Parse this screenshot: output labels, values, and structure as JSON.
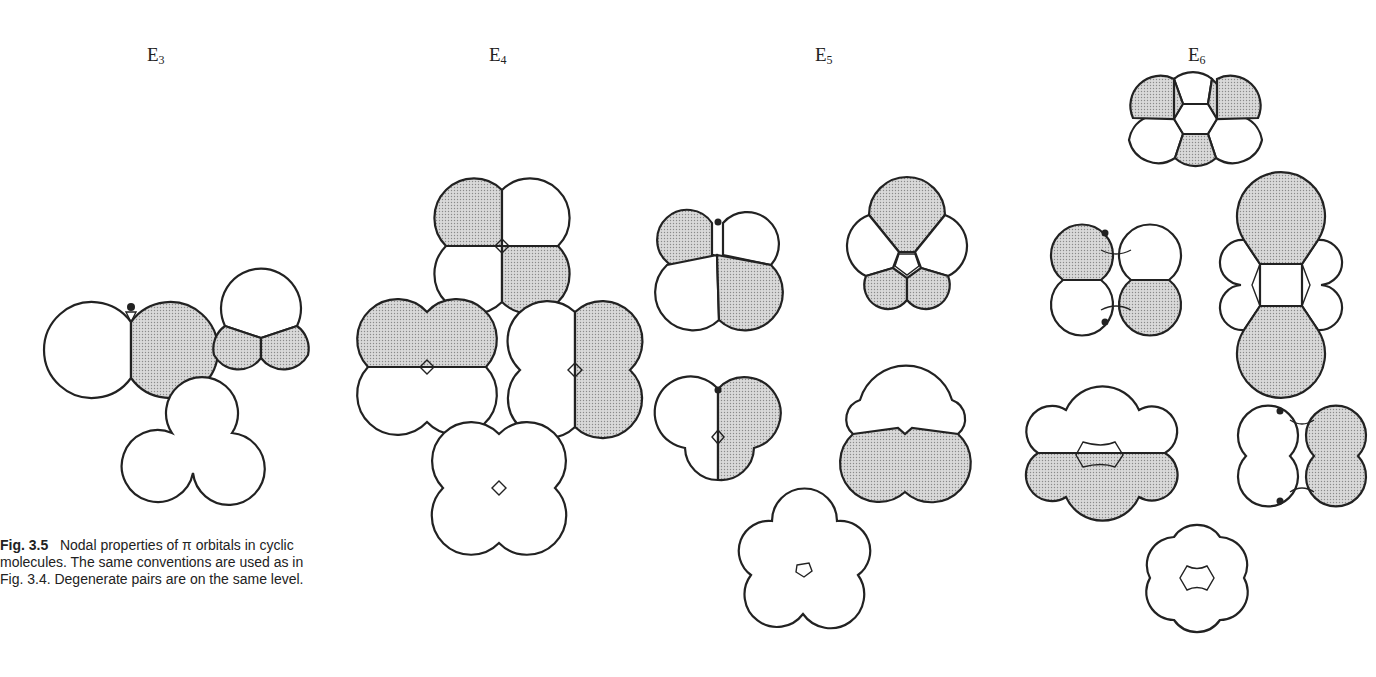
{
  "figure": {
    "columns": [
      {
        "id": "E3",
        "label_main": "E",
        "label_sub": "3",
        "x": 147
      },
      {
        "id": "E4",
        "label_main": "E",
        "label_sub": "4",
        "x": 489
      },
      {
        "id": "E5",
        "label_main": "E",
        "label_sub": "5",
        "x": 815
      },
      {
        "id": "E6",
        "label_main": "E",
        "label_sub": "6",
        "x": 1188
      }
    ],
    "shading": {
      "shaded_fill": "#c8c8c8",
      "outline": "#222222",
      "background": "#ffffff"
    }
  },
  "caption": {
    "label": "Fig. 3.5",
    "text": "Nodal properties of π orbitals in cyclic molecules. The same conventions are used as in Fig. 3.4. Degenerate pairs are on the same level."
  }
}
